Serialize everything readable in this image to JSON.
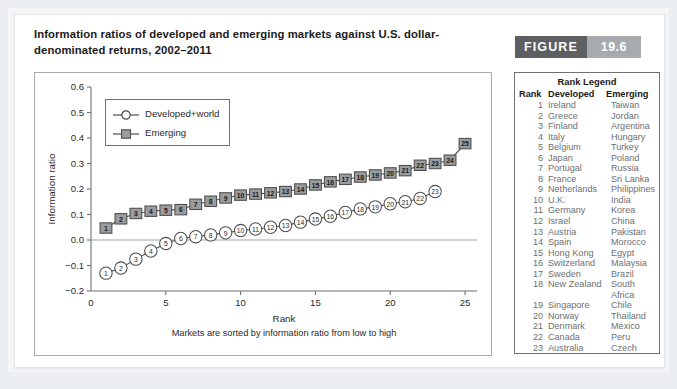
{
  "figure": {
    "word": "FIGURE",
    "number": "19.6",
    "word_color": "#5d6063",
    "number_color": "#a7abae"
  },
  "title": "Information ratios of developed and emerging markets against U.S. dollar-denominated returns, 2002–2011",
  "rank_legend": {
    "title": "Rank Legend",
    "headers": {
      "rank": "Rank",
      "developed": "Developed",
      "emerging": "Emerging"
    },
    "rows": [
      {
        "rank": "1",
        "developed": "Ireland",
        "emerging": "Taiwan"
      },
      {
        "rank": "2",
        "developed": "Greece",
        "emerging": "Jordan"
      },
      {
        "rank": "3",
        "developed": "Finland",
        "emerging": "Argentina"
      },
      {
        "rank": "4",
        "developed": "Italy",
        "emerging": "Hungary"
      },
      {
        "rank": "5",
        "developed": "Belgium",
        "emerging": "Turkey"
      },
      {
        "rank": "6",
        "developed": "Japan",
        "emerging": "Poland"
      },
      {
        "rank": "7",
        "developed": "Portugal",
        "emerging": "Russia"
      },
      {
        "rank": "8",
        "developed": "France",
        "emerging": "Sri Lanka"
      },
      {
        "rank": "9",
        "developed": "Netherlands",
        "emerging": "Philippines"
      },
      {
        "rank": "10",
        "developed": "U.K.",
        "emerging": "India"
      },
      {
        "rank": "11",
        "developed": "Germany",
        "emerging": "Korea"
      },
      {
        "rank": "12",
        "developed": "Israel",
        "emerging": "China"
      },
      {
        "rank": "13",
        "developed": "Austria",
        "emerging": "Pakistan"
      },
      {
        "rank": "14",
        "developed": "Spain",
        "emerging": "Morocco"
      },
      {
        "rank": "15",
        "developed": "Hong Kong",
        "emerging": "Egypt"
      },
      {
        "rank": "16",
        "developed": "Switzerland",
        "emerging": "Malaysia"
      },
      {
        "rank": "17",
        "developed": "Sweden",
        "emerging": "Brazil"
      },
      {
        "rank": "18",
        "developed": "New Zealand",
        "emerging": "South Africa"
      },
      {
        "rank": "19",
        "developed": "Singapore",
        "emerging": "Chile"
      },
      {
        "rank": "20",
        "developed": "Norway",
        "emerging": "Thailand"
      },
      {
        "rank": "21",
        "developed": "Denmark",
        "emerging": "Mexico"
      },
      {
        "rank": "22",
        "developed": "Canada",
        "emerging": "Peru"
      },
      {
        "rank": "23",
        "developed": "Australia",
        "emerging": "Czech Republic"
      },
      {
        "rank": "24",
        "developed": "",
        "emerging": "Indonesia"
      },
      {
        "rank": "25",
        "developed": "",
        "emerging": "Colombia"
      }
    ]
  },
  "chart_data": {
    "type": "line",
    "title": "",
    "xlabel": "Rank",
    "ylabel": "Information ratio",
    "caption": "Markets are sorted by information ratio from low to high",
    "xlim": [
      0,
      25.8
    ],
    "ylim": [
      -0.2,
      0.6
    ],
    "xticks": [
      0,
      5,
      10,
      15,
      20,
      25
    ],
    "xtick_labels": [
      "0",
      "5",
      "10",
      "15",
      "20",
      "25"
    ],
    "yticks": [
      -0.2,
      -0.1,
      0.0,
      0.1,
      0.2,
      0.3,
      0.4,
      0.5,
      0.6
    ],
    "ytick_labels": [
      "−0.2",
      "−0.1",
      "0.0",
      "0.1",
      "0.2",
      "0.3",
      "0.4",
      "0.5",
      "0.6"
    ],
    "grid": false,
    "zero_line": true,
    "legend_position": "upper-left-inside",
    "series": [
      {
        "name": "Developed+world",
        "marker": "circle",
        "marker_fill": "#ffffff",
        "marker_edge": "#4d4d4d",
        "line_color": "#4d4d4d",
        "x": [
          1,
          2,
          3,
          4,
          5,
          6,
          7,
          8,
          9,
          10,
          11,
          12,
          13,
          14,
          15,
          16,
          17,
          18,
          19,
          20,
          21,
          22,
          23
        ],
        "values": [
          -0.13,
          -0.11,
          -0.075,
          -0.043,
          -0.014,
          0.006,
          0.013,
          0.02,
          0.028,
          0.037,
          0.043,
          0.05,
          0.057,
          0.07,
          0.082,
          0.093,
          0.108,
          0.122,
          0.13,
          0.142,
          0.15,
          0.163,
          0.19
        ]
      },
      {
        "name": "Emerging",
        "marker": "square",
        "marker_fill": "#9a9c9e",
        "marker_edge": "#4d4d4d",
        "line_color": "#4d4d4d",
        "x": [
          1,
          2,
          3,
          4,
          5,
          6,
          7,
          8,
          9,
          10,
          11,
          12,
          13,
          14,
          15,
          16,
          17,
          18,
          19,
          20,
          21,
          22,
          23,
          24,
          25
        ],
        "values": [
          0.047,
          0.083,
          0.104,
          0.113,
          0.117,
          0.119,
          0.14,
          0.152,
          0.165,
          0.176,
          0.18,
          0.185,
          0.19,
          0.2,
          0.216,
          0.228,
          0.238,
          0.247,
          0.255,
          0.263,
          0.272,
          0.293,
          0.3,
          0.313,
          0.378
        ]
      }
    ]
  }
}
